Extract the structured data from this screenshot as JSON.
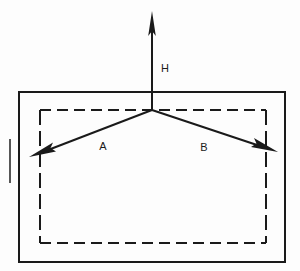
{
  "diagram": {
    "background_color": "#fdfdfd",
    "line_color": "#1a1a1a",
    "labels": {
      "vertical_vector": "H",
      "left_vector": "A",
      "right_vector": "B"
    },
    "outer_rectangle": {
      "style": "solid",
      "x": 19,
      "y": 92,
      "width": 266,
      "height": 170,
      "stroke_width": 2
    },
    "inner_rectangle": {
      "style": "dashed",
      "x": 40,
      "y": 110,
      "width": 226,
      "height": 133,
      "stroke_width": 2,
      "dash_horizontal": "10 6",
      "dash_vertical": "14 6"
    },
    "vertex": {
      "x": 152,
      "y": 110
    },
    "vectors": [
      {
        "name": "H",
        "from_x": 152,
        "from_y": 110,
        "to_x": 152,
        "to_y": 11,
        "label_x": 161,
        "label_y": 68,
        "direction": "up"
      },
      {
        "name": "A",
        "from_x": 152,
        "from_y": 110,
        "to_x": 29,
        "to_y": 157,
        "label_x": 103,
        "label_y": 146,
        "direction": "down-left"
      },
      {
        "name": "B",
        "from_x": 152,
        "from_y": 110,
        "to_x": 278,
        "to_y": 152,
        "label_x": 201,
        "label_y": 147,
        "direction": "down-right"
      }
    ],
    "edge_artifact": {
      "x": 10,
      "y_top": 140,
      "y_bottom": 182
    }
  }
}
